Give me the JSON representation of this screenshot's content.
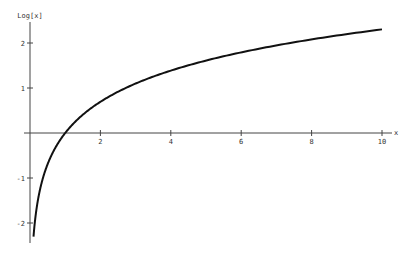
{
  "chart_data": {
    "type": "line",
    "title": "",
    "xlabel": "x",
    "ylabel": "Log[x]",
    "function": "Log[x]",
    "x_range": [
      0.1,
      10
    ],
    "xlim": [
      0,
      10
    ],
    "ylim": [
      -2.4,
      2.5
    ],
    "x_ticks": [
      2,
      4,
      6,
      8,
      10
    ],
    "x_tick_labels": [
      "2",
      "4",
      "6",
      "8",
      "10"
    ],
    "y_ticks": [
      -2,
      -1,
      1,
      2
    ],
    "y_tick_labels": [
      "-2",
      "-1",
      "1",
      "2"
    ],
    "grid": false,
    "legend": null,
    "series": [
      {
        "name": "Log[x]",
        "x": [
          0.1,
          0.2,
          0.3,
          0.5,
          0.75,
          1,
          1.5,
          2,
          3,
          4,
          5,
          6,
          7,
          8,
          9,
          10
        ],
        "y": [
          -2.303,
          -1.609,
          -1.204,
          -0.693,
          -0.288,
          0,
          0.405,
          0.693,
          1.099,
          1.386,
          1.609,
          1.792,
          1.946,
          2.079,
          2.197,
          2.303
        ]
      }
    ],
    "line_color": "#111111"
  }
}
